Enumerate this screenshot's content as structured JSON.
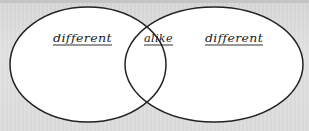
{
  "diagram": {
    "type": "venn",
    "background_color": "#dcdcdc",
    "stroke_color": "#222222",
    "fill_color": "#ffffff",
    "sets": [
      {
        "id": "left",
        "label": "different",
        "ellipse": {
          "cx": 88,
          "cy": 64.5,
          "rx": 78,
          "ry": 57.5
        }
      },
      {
        "id": "right",
        "label": "different",
        "ellipse": {
          "cx": 214,
          "cy": 64.5,
          "rx": 89,
          "ry": 57.5
        }
      }
    ],
    "intersection": {
      "label": "alike"
    }
  }
}
